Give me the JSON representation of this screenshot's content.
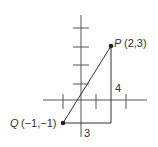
{
  "diagram": {
    "type": "coordinate-plane-right-triangle",
    "points": [
      {
        "name": "P",
        "coords": "(2,3)",
        "x": 2,
        "y": 3
      },
      {
        "name": "Q",
        "coords": "(−1,−1)",
        "x": -1,
        "y": -1
      }
    ],
    "labels": {
      "p_name": "P",
      "p_coords": "(2,3)",
      "q_name": "Q",
      "q_coords": "(−1,−1)",
      "vertical_leg": "4",
      "horizontal_leg": "3"
    },
    "colors": {
      "axis": "#555555",
      "line": "#333333",
      "text": "#333333",
      "point": "#222222"
    }
  }
}
